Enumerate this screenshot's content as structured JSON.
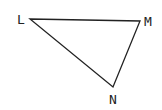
{
  "diagram": {
    "type": "triangle",
    "vertices": [
      {
        "label": "L",
        "x": 30,
        "y": 19,
        "label_x": 17,
        "label_y": 24
      },
      {
        "label": "M",
        "x": 140,
        "y": 21,
        "label_x": 144,
        "label_y": 26
      },
      {
        "label": "N",
        "x": 113,
        "y": 87,
        "label_x": 109,
        "label_y": 104
      }
    ],
    "stroke_color": "#222222"
  }
}
